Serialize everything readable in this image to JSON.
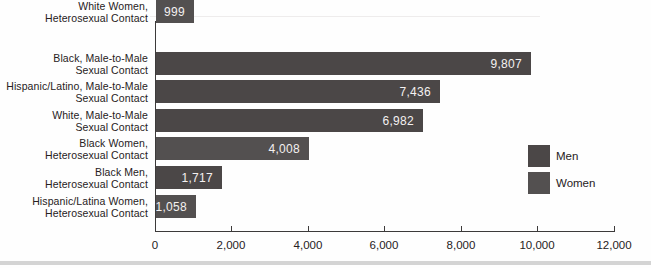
{
  "chart_data": {
    "type": "bar",
    "orientation": "horizontal",
    "title": "",
    "xlabel": "",
    "ylabel": "",
    "xlim": [
      0,
      12000
    ],
    "x_tick_values": [
      0,
      2000,
      4000,
      6000,
      8000,
      10000,
      12000
    ],
    "x_ticks": [
      "0",
      "2,000",
      "4,000",
      "6,000",
      "8,000",
      "10,000",
      "12,000"
    ],
    "grid": false,
    "categories": [
      "Black, Male-to-Male Sexual Contact",
      "Hispanic/Latino, Male-to-Male Sexual Contact",
      "White, Male-to-Male Sexual Contact",
      "Black Women, Heterosexual Contact",
      "Black Men, Heterosexual Contact",
      "Hispanic/Latina Women, Heterosexual Contact",
      "White Women, Heterosexual Contact"
    ],
    "values": [
      9807,
      7436,
      6982,
      4008,
      1717,
      1058,
      999
    ],
    "rows": [
      {
        "line1": "Black, Male-to-Male",
        "line2": "Sexual Contact",
        "value": 9807,
        "value_label": "9,807",
        "series": "Men"
      },
      {
        "line1": "Hispanic/Latino, Male-to-Male",
        "line2": "Sexual Contact",
        "value": 7436,
        "value_label": "7,436",
        "series": "Men"
      },
      {
        "line1": "White, Male-to-Male",
        "line2": "Sexual Contact",
        "value": 6982,
        "value_label": "6,982",
        "series": "Men"
      },
      {
        "line1": "Black Women,",
        "line2": "Heterosexual Contact",
        "value": 4008,
        "value_label": "4,008",
        "series": "Women"
      },
      {
        "line1": "Black Men,",
        "line2": "Heterosexual Contact",
        "value": 1717,
        "value_label": "1,717",
        "series": "Men"
      },
      {
        "line1": "Hispanic/Latina Women,",
        "line2": "Heterosexual Contact",
        "value": 1058,
        "value_label": "1,058",
        "series": "Women"
      },
      {
        "line1": "White Women,",
        "line2": "Heterosexual Contact",
        "value": 999,
        "value_label": "999",
        "series": "Women"
      }
    ],
    "series_colors": {
      "Men": "#4b4747",
      "Women": "#535050"
    },
    "legend": {
      "position": "right",
      "items": [
        {
          "label": "Men",
          "series": "Men"
        },
        {
          "label": "Women",
          "series": "Women"
        }
      ]
    }
  }
}
